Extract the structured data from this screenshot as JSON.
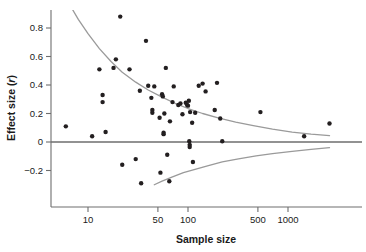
{
  "chart_data": {
    "type": "scatter",
    "title": "",
    "xlabel": "Sample size",
    "ylabel": "Effect size (r)",
    "ylabel_plain": "Effect size",
    "ylabel_italic_part": "r",
    "x_scale": "log",
    "y_scale": "linear",
    "xlim": [
      5,
      3000
    ],
    "ylim": [
      -0.29,
      0.93
    ],
    "grid": false,
    "legend": null,
    "x_ticks": [
      10,
      50,
      100,
      500,
      1000
    ],
    "x_tick_labels": [
      "10",
      "50",
      "100",
      "500",
      "1000"
    ],
    "y_ticks": [
      -0.2,
      0,
      0.2,
      0.4,
      0.6,
      0.8
    ],
    "y_tick_labels": [
      "−0.2",
      "0",
      "0.2",
      "0.4",
      "0.6",
      "0.8"
    ],
    "reference_line_y": 0,
    "reference_line_color": "#6e6e6e",
    "funnel_color": "#9a9a9a",
    "point_color": "#231f20",
    "axis_color": "#6e6e6e",
    "points": [
      {
        "n": 6,
        "r": 0.11
      },
      {
        "n": 11,
        "r": 0.04
      },
      {
        "n": 13,
        "r": 0.51
      },
      {
        "n": 14,
        "r": 0.33
      },
      {
        "n": 14,
        "r": 0.28
      },
      {
        "n": 15,
        "r": 0.07
      },
      {
        "n": 18,
        "r": 0.52
      },
      {
        "n": 19,
        "r": 0.58
      },
      {
        "n": 21,
        "r": 0.88
      },
      {
        "n": 22,
        "r": -0.16
      },
      {
        "n": 26,
        "r": 0.51
      },
      {
        "n": 30,
        "r": -0.12
      },
      {
        "n": 33,
        "r": 0.36
      },
      {
        "n": 34,
        "r": -0.29
      },
      {
        "n": 38,
        "r": 0.71
      },
      {
        "n": 40,
        "r": 0.395
      },
      {
        "n": 43,
        "r": 0.31
      },
      {
        "n": 44,
        "r": 0.225
      },
      {
        "n": 44,
        "r": 0.205
      },
      {
        "n": 46,
        "r": 0.39
      },
      {
        "n": 52,
        "r": 0.17
      },
      {
        "n": 53,
        "r": -0.215
      },
      {
        "n": 55,
        "r": 0.335
      },
      {
        "n": 56,
        "r": 0.32
      },
      {
        "n": 57,
        "r": 0.065
      },
      {
        "n": 57,
        "r": 0.055
      },
      {
        "n": 58,
        "r": 0.2
      },
      {
        "n": 60,
        "r": 0.52
      },
      {
        "n": 62,
        "r": -0.09
      },
      {
        "n": 65,
        "r": -0.275
      },
      {
        "n": 66,
        "r": 0.145
      },
      {
        "n": 70,
        "r": 0.28
      },
      {
        "n": 72,
        "r": 0.39
      },
      {
        "n": 80,
        "r": 0.26
      },
      {
        "n": 84,
        "r": 0.27
      },
      {
        "n": 88,
        "r": 0.195
      },
      {
        "n": 95,
        "r": 0.275
      },
      {
        "n": 98,
        "r": 0.26
      },
      {
        "n": 100,
        "r": 0.255
      },
      {
        "n": 102,
        "r": 0.29
      },
      {
        "n": 103,
        "r": 0.005
      },
      {
        "n": 104,
        "r": -0.02
      },
      {
        "n": 104,
        "r": -0.035
      },
      {
        "n": 105,
        "r": 0.21
      },
      {
        "n": 110,
        "r": 0.135
      },
      {
        "n": 112,
        "r": -0.14
      },
      {
        "n": 118,
        "r": 0.205
      },
      {
        "n": 128,
        "r": 0.395
      },
      {
        "n": 140,
        "r": 0.41
      },
      {
        "n": 150,
        "r": 0.355
      },
      {
        "n": 185,
        "r": 0.225
      },
      {
        "n": 195,
        "r": 0.415
      },
      {
        "n": 210,
        "r": 0.165
      },
      {
        "n": 220,
        "r": 0.005
      },
      {
        "n": 530,
        "r": 0.21
      },
      {
        "n": 1450,
        "r": 0.04
      },
      {
        "n": 2600,
        "r": 0.13
      }
    ],
    "funnel_upper": [
      {
        "n": 7,
        "r": 0.93
      },
      {
        "n": 8,
        "r": 0.86
      },
      {
        "n": 10,
        "r": 0.76
      },
      {
        "n": 13,
        "r": 0.655
      },
      {
        "n": 17,
        "r": 0.565
      },
      {
        "n": 22,
        "r": 0.49
      },
      {
        "n": 30,
        "r": 0.42
      },
      {
        "n": 40,
        "r": 0.365
      },
      {
        "n": 55,
        "r": 0.315
      },
      {
        "n": 75,
        "r": 0.27
      },
      {
        "n": 100,
        "r": 0.235
      },
      {
        "n": 140,
        "r": 0.2
      },
      {
        "n": 200,
        "r": 0.17
      },
      {
        "n": 300,
        "r": 0.14
      },
      {
        "n": 450,
        "r": 0.115
      },
      {
        "n": 700,
        "r": 0.09
      },
      {
        "n": 1100,
        "r": 0.07
      },
      {
        "n": 1700,
        "r": 0.055
      },
      {
        "n": 2600,
        "r": 0.045
      }
    ],
    "funnel_lower": [
      {
        "n": 46,
        "r": -0.3
      },
      {
        "n": 55,
        "r": -0.275
      },
      {
        "n": 70,
        "r": -0.245
      },
      {
        "n": 90,
        "r": -0.215
      },
      {
        "n": 120,
        "r": -0.19
      },
      {
        "n": 160,
        "r": -0.165
      },
      {
        "n": 220,
        "r": -0.14
      },
      {
        "n": 320,
        "r": -0.118
      },
      {
        "n": 480,
        "r": -0.098
      },
      {
        "n": 700,
        "r": -0.082
      },
      {
        "n": 1100,
        "r": -0.066
      },
      {
        "n": 1700,
        "r": -0.052
      },
      {
        "n": 2600,
        "r": -0.04
      }
    ]
  }
}
